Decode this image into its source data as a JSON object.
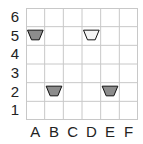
{
  "grid": {
    "columns": [
      "A",
      "B",
      "C",
      "D",
      "E",
      "F"
    ],
    "rows": [
      "6",
      "5",
      "4",
      "3",
      "2",
      "1"
    ],
    "line_color": "#c8c8c8",
    "border_color": "#c0c0c0"
  },
  "pieces": [
    {
      "col": "A",
      "row": "5",
      "shape": "trapezoid",
      "fill": "#8c8c8c"
    },
    {
      "col": "D",
      "row": "5",
      "shape": "trapezoid",
      "fill": "#f4f4f4"
    },
    {
      "col": "B",
      "row": "2",
      "shape": "trapezoid",
      "fill": "#8c8c8c"
    },
    {
      "col": "E",
      "row": "2",
      "shape": "trapezoid",
      "fill": "#8c8c8c"
    }
  ],
  "labels": {
    "rows": {
      "r0": "6",
      "r1": "5",
      "r2": "4",
      "r3": "3",
      "r4": "2",
      "r5": "1"
    },
    "cols": {
      "c0": "A",
      "c1": "B",
      "c2": "C",
      "c3": "D",
      "c4": "E",
      "c5": "F"
    }
  }
}
